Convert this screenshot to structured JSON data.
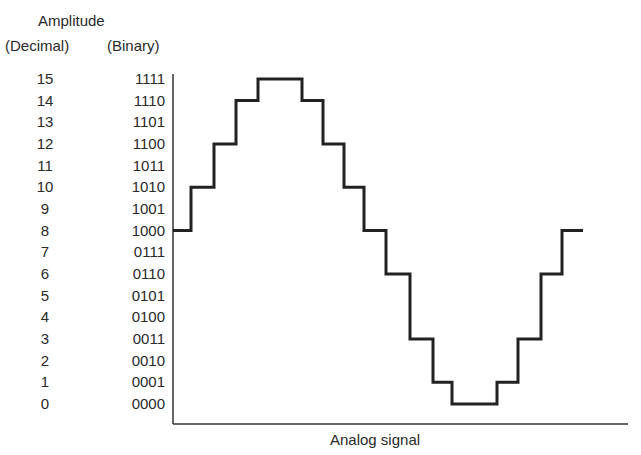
{
  "header": {
    "amplitude": "Amplitude",
    "decimal": "(Decimal)",
    "binary": "(Binary)"
  },
  "xaxis": {
    "label": "Analog signal"
  },
  "levels": [
    {
      "dec": "15",
      "bin": "1111"
    },
    {
      "dec": "14",
      "bin": "1110"
    },
    {
      "dec": "13",
      "bin": "1101"
    },
    {
      "dec": "12",
      "bin": "1100"
    },
    {
      "dec": "11",
      "bin": "1011"
    },
    {
      "dec": "10",
      "bin": "1010"
    },
    {
      "dec": "9",
      "bin": "1001"
    },
    {
      "dec": "8",
      "bin": "1000"
    },
    {
      "dec": "7",
      "bin": "0111"
    },
    {
      "dec": "6",
      "bin": "0110"
    },
    {
      "dec": "5",
      "bin": "0101"
    },
    {
      "dec": "4",
      "bin": "0100"
    },
    {
      "dec": "3",
      "bin": "0011"
    },
    {
      "dec": "2",
      "bin": "0010"
    },
    {
      "dec": "1",
      "bin": "0001"
    },
    {
      "dec": "0",
      "bin": "0000"
    }
  ],
  "waveform": {
    "type": "step",
    "description": "Quantized (4-bit) sine wave",
    "steps": [
      {
        "x0": 173,
        "x1": 191,
        "level": 8
      },
      {
        "x0": 191,
        "x1": 214,
        "level": 10
      },
      {
        "x0": 214,
        "x1": 236,
        "level": 12
      },
      {
        "x0": 236,
        "x1": 258,
        "level": 14
      },
      {
        "x0": 258,
        "x1": 302,
        "level": 15
      },
      {
        "x0": 302,
        "x1": 323,
        "level": 14
      },
      {
        "x0": 323,
        "x1": 344,
        "level": 12
      },
      {
        "x0": 344,
        "x1": 364,
        "level": 10
      },
      {
        "x0": 364,
        "x1": 386,
        "level": 8
      },
      {
        "x0": 386,
        "x1": 410,
        "level": 6
      },
      {
        "x0": 410,
        "x1": 433,
        "level": 3
      },
      {
        "x0": 433,
        "x1": 452,
        "level": 1
      },
      {
        "x0": 452,
        "x1": 497,
        "level": 0
      },
      {
        "x0": 497,
        "x1": 518,
        "level": 1
      },
      {
        "x0": 518,
        "x1": 541,
        "level": 3
      },
      {
        "x0": 541,
        "x1": 562,
        "level": 6
      },
      {
        "x0": 562,
        "x1": 583,
        "level": 8
      }
    ],
    "sample_sequence": [
      8,
      10,
      12,
      14,
      15,
      14,
      12,
      10,
      8,
      6,
      3,
      1,
      0,
      1,
      3,
      6,
      8
    ]
  },
  "colors": {
    "line": "#222222",
    "text": "#2a2a2a",
    "background": "#ffffff"
  }
}
